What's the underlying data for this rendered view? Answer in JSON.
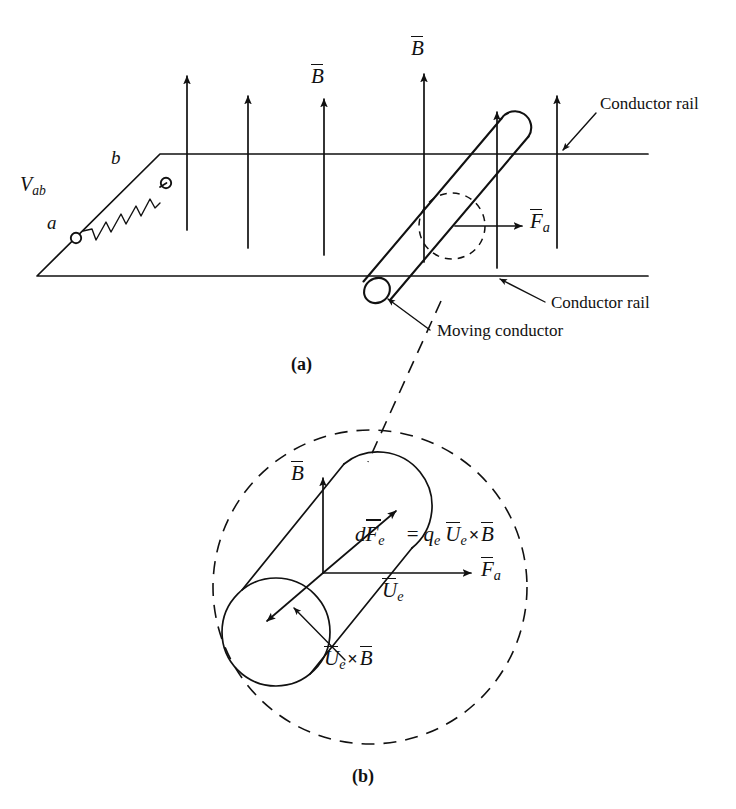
{
  "figure": {
    "panels": [
      {
        "id": "a",
        "caption": "(a)"
      },
      {
        "id": "b",
        "caption": "(b)"
      }
    ],
    "stroke_color": "#111111",
    "background_color": "#ffffff"
  },
  "panel_a": {
    "caption": "(a)",
    "labels": {
      "b_field_left": "B",
      "b_field_right": "B",
      "applied_force": "F",
      "applied_force_sub": "a",
      "voltage": "V",
      "voltage_sub": "ab",
      "terminal_a": "a",
      "terminal_b": "b",
      "conductor_rail_top": "Conductor rail",
      "conductor_rail_bottom": "Conductor rail",
      "moving_conductor": "Moving conductor"
    },
    "b_field_arrows": [
      {
        "x": 187,
        "y_base": 230,
        "y_tip": 72
      },
      {
        "x": 248,
        "y_base": 248,
        "y_tip": 92
      },
      {
        "x": 324,
        "y_base": 255,
        "y_tip": 95
      },
      {
        "x": 424,
        "y_base": 262,
        "y_tip": 70
      },
      {
        "x": 497,
        "y_base": 268,
        "y_tip": 108
      },
      {
        "x": 557,
        "y_base": 248,
        "y_tip": 92
      }
    ],
    "rails": {
      "top_rail_y": 154,
      "bottom_rail_y": 276,
      "top_rail_x_start": 160,
      "top_rail_x_end": 648,
      "bottom_rail_x_start": 37,
      "bottom_rail_x_end": 648
    },
    "moving_rod": {
      "top_end_x": 516,
      "top_end_y": 127,
      "bottom_end_x": 378,
      "bottom_end_y": 290,
      "radius": 9
    },
    "detail_callout_circle": {
      "cx": 452,
      "cy": 226,
      "r": 33
    }
  },
  "panel_b": {
    "caption": "(b)",
    "labels": {
      "b_field": "B",
      "force_electron": "dF",
      "force_electron_sub": "e",
      "equals": "=",
      "charge": "q",
      "charge_sub": "e",
      "velocity": "U",
      "velocity_sub": "e",
      "cross": "×",
      "b_field_rhs": "B",
      "applied_force": "F",
      "applied_force_sub": "a",
      "velocity_label": "U",
      "velocity_label_sub": "e",
      "cross_product_label_u": "U",
      "cross_product_label_u_sub": "e",
      "cross_product_label_cross": "×",
      "cross_product_label_b": "B"
    },
    "equation_text": "dFe = qe Ue × B",
    "dashed_circle": {
      "cx": 370,
      "cy": 587,
      "r": 157
    },
    "cylinder": {
      "axis_top_x": 378,
      "axis_top_y": 506,
      "axis_bottom_x": 276,
      "axis_bottom_y": 632,
      "radius": 48
    },
    "vector_origin": {
      "x": 323,
      "y": 573
    },
    "vectors": [
      {
        "name": "B",
        "dx": 0,
        "dy": -95,
        "label": "B"
      },
      {
        "name": "Fa",
        "dx": 148,
        "dy": 0,
        "label": "Fa"
      },
      {
        "name": "dFe",
        "dx": 73,
        "dy": -62,
        "label": "dFe"
      },
      {
        "name": "UexB",
        "dx": -56,
        "dy": 48,
        "label": "Ue x B"
      }
    ]
  },
  "leader_line": {
    "from_x": 441,
    "from_y": 301,
    "to_x": 368,
    "to_y": 462,
    "style": "dashed"
  }
}
